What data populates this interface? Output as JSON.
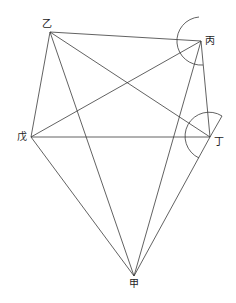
{
  "diagram": {
    "points": {
      "yi": {
        "label": "乙",
        "x": 50,
        "y": 32
      },
      "bing": {
        "label": "丙",
        "x": 201,
        "y": 41
      },
      "ding": {
        "label": "丁",
        "x": 210,
        "y": 137
      },
      "wu": {
        "label": "戊",
        "x": 31,
        "y": 137
      },
      "jia": {
        "label": "甲",
        "x": 134,
        "y": 276
      }
    },
    "segments": [
      [
        "乙",
        "丙"
      ],
      [
        "乙",
        "丁"
      ],
      [
        "乙",
        "戊"
      ],
      [
        "乙",
        "甲"
      ],
      [
        "丙",
        "戊"
      ],
      [
        "丙",
        "丁"
      ],
      [
        "丙",
        "甲"
      ],
      [
        "戊",
        "丁"
      ],
      [
        "戊",
        "甲"
      ],
      [
        "丁",
        "甲"
      ]
    ],
    "angle_marks": [
      {
        "at": "丙",
        "type": "arc"
      },
      {
        "at": "丁",
        "type": "arc"
      }
    ],
    "line_color": "#3a3a3a"
  }
}
